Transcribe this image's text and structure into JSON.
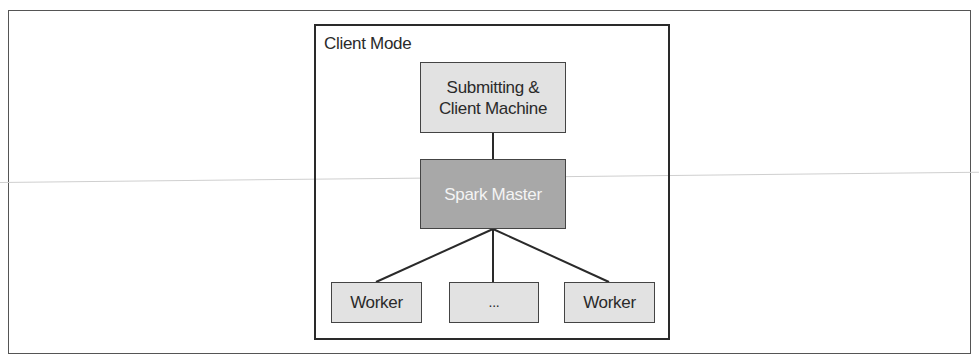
{
  "diagram": {
    "frame_title": "Client Mode",
    "nodes": {
      "client": "Submitting & Client Machine",
      "client_line1": "Submitting &",
      "client_line2": "Client Machine",
      "master": "Spark Master",
      "workers": [
        "Worker",
        "...",
        "Worker"
      ]
    },
    "edges": [
      [
        "Submitting & Client Machine",
        "Spark Master"
      ],
      [
        "Spark Master",
        "Worker"
      ],
      [
        "Spark Master",
        "..."
      ],
      [
        "Spark Master",
        "Worker"
      ]
    ],
    "colors": {
      "light_box": "#e2e2e2",
      "master_box": "#a8a8a8",
      "border": "#2a2a2a"
    }
  }
}
